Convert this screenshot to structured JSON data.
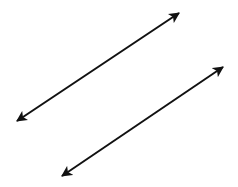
{
  "diagram": {
    "background": "#ffffff",
    "stroke_color": "#111111",
    "stroke_width": 2,
    "lines": [
      {
        "id": "line-1",
        "x1": 17,
        "y1": 121,
        "x2": 179,
        "y2": 13,
        "arrows": "both"
      },
      {
        "id": "line-2",
        "x1": 62,
        "y1": 176,
        "x2": 223,
        "y2": 67,
        "arrows": "both"
      }
    ]
  }
}
